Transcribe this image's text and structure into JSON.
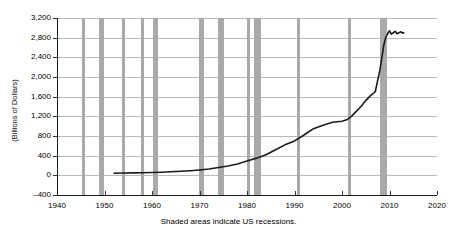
{
  "chart_data": {
    "type": "line",
    "title": "",
    "subtitle": "",
    "xlabel": "",
    "ylabel": "(Billions of Dollars)",
    "caption": "Shaded areas indicate US recessions.",
    "xlim": [
      1940,
      2020
    ],
    "ylim": [
      -400,
      3200
    ],
    "grid": true,
    "legend": false,
    "legend_position": "none",
    "x_ticks": [
      1940,
      1950,
      1960,
      1970,
      1980,
      1990,
      2000,
      2010,
      2020
    ],
    "x_tick_labels": [
      "1940",
      "1950",
      "1960",
      "1970",
      "1980",
      "1990",
      "2000",
      "2010",
      "2020"
    ],
    "y_ticks": [
      -400,
      0,
      400,
      800,
      1200,
      1600,
      2000,
      2400,
      2800,
      3200
    ],
    "y_tick_labels": [
      "–400",
      "0",
      "400",
      "800",
      "1,200",
      "1,600",
      "2,000",
      "2,400",
      "2,800",
      "3,200"
    ],
    "series": [
      {
        "name": "Monetary Base",
        "color": "#1a1a1a",
        "x": [
          1952,
          1954,
          1956,
          1958,
          1960,
          1962,
          1964,
          1966,
          1968,
          1970,
          1972,
          1974,
          1976,
          1978,
          1980,
          1982,
          1984,
          1986,
          1988,
          1990,
          1992,
          1994,
          1996,
          1998,
          2000,
          2001,
          2002,
          2003,
          2004,
          2005,
          2006,
          2007,
          2008,
          2008.8,
          2009.2,
          2009.6,
          2010,
          2010.4,
          2010.8,
          2011.2,
          2011.6,
          2012,
          2012.4,
          2012.8,
          2013
        ],
        "y": [
          42,
          46,
          50,
          54,
          58,
          64,
          72,
          82,
          94,
          110,
          130,
          160,
          190,
          230,
          290,
          350,
          420,
          520,
          620,
          700,
          820,
          950,
          1020,
          1080,
          1100,
          1130,
          1200,
          1300,
          1400,
          1520,
          1620,
          1700,
          2150,
          2650,
          2800,
          2880,
          2940,
          2870,
          2900,
          2930,
          2880,
          2900,
          2920,
          2890,
          2905
        ]
      }
    ],
    "recessions": [
      {
        "start": 1945.2,
        "end": 1945.9
      },
      {
        "start": 1948.9,
        "end": 1949.9
      },
      {
        "start": 1953.6,
        "end": 1954.4
      },
      {
        "start": 1957.7,
        "end": 1958.4
      },
      {
        "start": 1960.3,
        "end": 1961.2
      },
      {
        "start": 1969.9,
        "end": 1970.9
      },
      {
        "start": 1973.9,
        "end": 1975.2
      },
      {
        "start": 1980.1,
        "end": 1980.6
      },
      {
        "start": 1981.5,
        "end": 1982.9
      },
      {
        "start": 1990.6,
        "end": 1991.2
      },
      {
        "start": 2001.2,
        "end": 2001.9
      },
      {
        "start": 2007.9,
        "end": 2009.5
      }
    ]
  }
}
